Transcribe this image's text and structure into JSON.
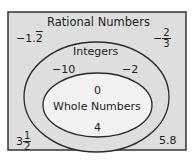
{
  "colors": {
    "rect_fill": "#dedede",
    "rect_stroke": "#333333",
    "integers_fill": "#dedede",
    "whole_fill": "#f2f2f2",
    "ellipse_stroke": "#2a2a2a",
    "text": "#222222"
  },
  "diagram": {
    "outer_set": {
      "label": "Rational Numbers",
      "members": [
        {
          "sign": "−",
          "whole": "1.",
          "repeating": "2"
        },
        {
          "sign": "−",
          "numerator": "2",
          "denominator": "3"
        },
        {
          "whole": "3",
          "numerator": "1",
          "denominator": "2"
        },
        {
          "value": "5.8"
        }
      ]
    },
    "middle_set": {
      "label": "Integers",
      "members": [
        "−10",
        "−2"
      ]
    },
    "inner_set": {
      "label": "Whole Numbers",
      "members": [
        "0",
        "4"
      ]
    }
  }
}
